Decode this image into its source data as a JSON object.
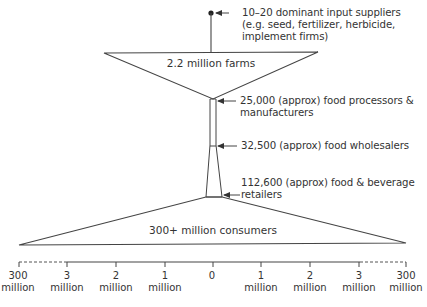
{
  "diagram": {
    "title": "",
    "colors": {
      "line": "#444444",
      "text": "#333333",
      "background": "#ffffff"
    },
    "top_funnel": {
      "label": "2.2 million farms"
    },
    "bottom_funnel": {
      "label": "300+ million consumers"
    },
    "annotations": [
      {
        "id": "input-suppliers",
        "lines": [
          "10–20 dominant input suppliers",
          "(e.g. seed, fertilizer, herbicide,",
          "implement firms)"
        ]
      },
      {
        "id": "processors",
        "lines": [
          "25,000 (approx) food processors &",
          "manufacturers"
        ]
      },
      {
        "id": "wholesalers",
        "lines": [
          "32,500 (approx) food wholesalers"
        ]
      },
      {
        "id": "retailers",
        "lines": [
          "112,600 (approx) food & beverage",
          "retailers"
        ]
      }
    ],
    "axis": {
      "ticks": [
        {
          "value": "300",
          "unit": "million"
        },
        {
          "value": "3",
          "unit": "million"
        },
        {
          "value": "2",
          "unit": "million"
        },
        {
          "value": "1",
          "unit": "million"
        },
        {
          "value": "0",
          "unit": ""
        },
        {
          "value": "1",
          "unit": "million"
        },
        {
          "value": "2",
          "unit": "million"
        },
        {
          "value": "3",
          "unit": "million"
        },
        {
          "value": "300",
          "unit": "million"
        }
      ]
    }
  }
}
